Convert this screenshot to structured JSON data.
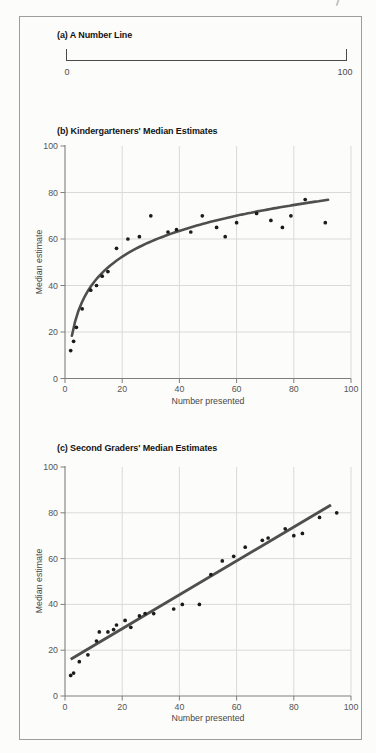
{
  "figure": {
    "panels": [
      "(a) A Number Line",
      "(b) Kindergarteners' Median Estimates",
      "(c) Second Graders' Median Estimates"
    ]
  },
  "colors": {
    "grid": "#dadada",
    "axis": "#7e7e7e",
    "tick_label": "#565656",
    "title": "#141414",
    "fit_line": "#4f4f4f",
    "point": "#1b1b1b",
    "number_line": "#4a4a4a",
    "frame": "#9e9e9e"
  },
  "chart_data": [
    {
      "type": "number-line",
      "title": "(a) A Number Line",
      "min": 0,
      "max": 100,
      "min_label": "0",
      "max_label": "100"
    },
    {
      "type": "scatter",
      "title": "(b) Kindergarteners' Median Estimates",
      "xlabel": "Number presented",
      "ylabel": "Median estimate",
      "xlim": [
        0,
        100
      ],
      "ylim": [
        0,
        100
      ],
      "xticks": [
        0,
        20,
        40,
        60,
        80,
        100
      ],
      "yticks": [
        0,
        20,
        40,
        60,
        80,
        100
      ],
      "grid": true,
      "points": [
        [
          2,
          12
        ],
        [
          3,
          16
        ],
        [
          4,
          22
        ],
        [
          6,
          30
        ],
        [
          9,
          38
        ],
        [
          11,
          40
        ],
        [
          13,
          44
        ],
        [
          15,
          46
        ],
        [
          18,
          56
        ],
        [
          22,
          60
        ],
        [
          26,
          61
        ],
        [
          30,
          70
        ],
        [
          36,
          63
        ],
        [
          39,
          64
        ],
        [
          44,
          63
        ],
        [
          48,
          70
        ],
        [
          53,
          65
        ],
        [
          56,
          61
        ],
        [
          60,
          67
        ],
        [
          67,
          71
        ],
        [
          72,
          68
        ],
        [
          76,
          65
        ],
        [
          79,
          70
        ],
        [
          84,
          77
        ],
        [
          91,
          67
        ]
      ],
      "fit": {
        "kind": "log",
        "formula": "y = 4.3 + 16.05*ln(x)",
        "a": 4.3,
        "b": 16.05,
        "x_start": 2.4,
        "x_end": 92,
        "width": 2.6
      }
    },
    {
      "type": "scatter",
      "title": "(c) Second Graders' Median Estimates",
      "xlabel": "Number presented",
      "ylabel": "Median estimate",
      "xlim": [
        0,
        100
      ],
      "ylim": [
        0,
        100
      ],
      "xticks": [
        0,
        20,
        40,
        60,
        80,
        100
      ],
      "yticks": [
        0,
        20,
        40,
        60,
        80,
        100
      ],
      "grid": true,
      "points": [
        [
          2,
          9
        ],
        [
          3,
          10
        ],
        [
          5,
          15
        ],
        [
          8,
          18
        ],
        [
          11,
          24
        ],
        [
          12,
          28
        ],
        [
          15,
          28
        ],
        [
          17,
          29
        ],
        [
          18,
          31
        ],
        [
          21,
          33
        ],
        [
          23,
          30
        ],
        [
          26,
          35
        ],
        [
          28,
          36
        ],
        [
          31,
          36
        ],
        [
          38,
          38
        ],
        [
          41,
          40
        ],
        [
          47,
          40
        ],
        [
          51,
          53
        ],
        [
          55,
          59
        ],
        [
          59,
          61
        ],
        [
          63,
          65
        ],
        [
          69,
          68
        ],
        [
          71,
          69
        ],
        [
          77,
          73
        ],
        [
          80,
          70
        ],
        [
          83,
          71
        ],
        [
          89,
          78
        ],
        [
          95,
          80
        ]
      ],
      "fit": {
        "kind": "linear",
        "formula": "y = 14.6 + 0.74x",
        "intercept": 14.6,
        "slope": 0.74,
        "x_start": 2,
        "x_end": 93,
        "width": 2.9
      }
    }
  ]
}
